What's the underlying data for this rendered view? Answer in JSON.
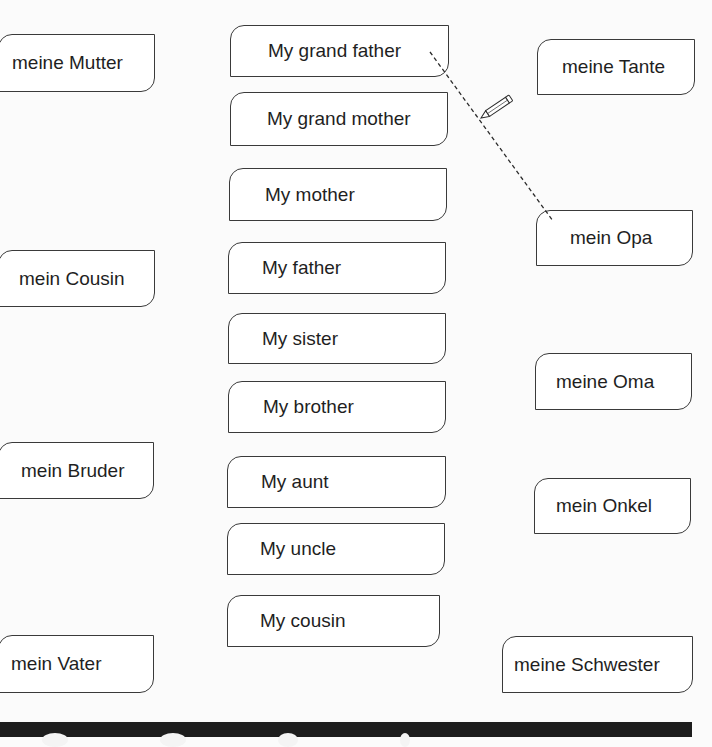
{
  "worksheet": {
    "left_column": [
      {
        "label": "meine Mutter"
      },
      {
        "label": "mein Cousin"
      },
      {
        "label": "mein Bruder"
      },
      {
        "label": "mein Vater"
      }
    ],
    "middle_column": [
      {
        "label": "My grand father"
      },
      {
        "label": "My grand mother"
      },
      {
        "label": "My mother"
      },
      {
        "label": "My father"
      },
      {
        "label": "My sister"
      },
      {
        "label": "My brother"
      },
      {
        "label": "My aunt"
      },
      {
        "label": "My uncle"
      },
      {
        "label": "My cousin"
      }
    ],
    "right_column": [
      {
        "label": "meine Tante"
      },
      {
        "label": "mein Opa"
      },
      {
        "label": "meine Oma"
      },
      {
        "label": "mein Onkel"
      },
      {
        "label": "meine Schwester"
      }
    ],
    "connection": {
      "from": "My grand father",
      "to": "mein Opa",
      "style": "dashed",
      "icon": "pencil-icon"
    }
  },
  "colors": {
    "border": "#3a3a3a",
    "background": "#fbfbfb",
    "footer": "#1d1d1d"
  }
}
